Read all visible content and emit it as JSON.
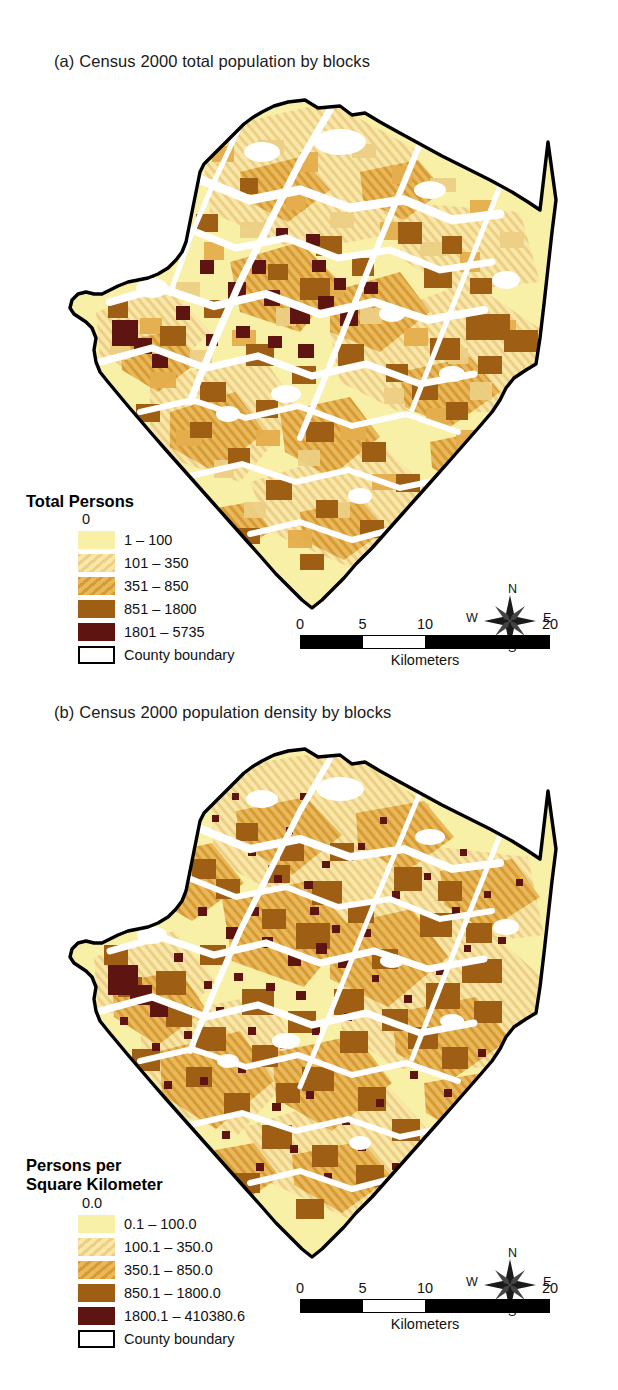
{
  "figure": {
    "panels": [
      {
        "id": "a",
        "title": "(a) Census 2000 total population by blocks",
        "legend": {
          "title": "Total Persons",
          "title_line2": "",
          "zero_label": "0",
          "classes": [
            {
              "label": "1 – 100",
              "color": "#f8f0a6",
              "pattern": "solid"
            },
            {
              "label": "101 – 350",
              "color": "#f4d98c",
              "pattern": "hatch"
            },
            {
              "label": "351 – 850",
              "color": "#e0a441",
              "pattern": "hatch"
            },
            {
              "label": "851 – 1800",
              "color": "#9e5e14",
              "pattern": "solid"
            },
            {
              "label": "1801 – 5735",
              "color": "#5e1410",
              "pattern": "solid"
            }
          ],
          "boundary_label": "County boundary"
        },
        "scalebar": {
          "ticks": [
            "0",
            "5",
            "10",
            "20"
          ],
          "unit": "Kilometers"
        },
        "compass": {
          "n": "N",
          "e": "E",
          "s": "S",
          "w": "W"
        }
      },
      {
        "id": "b",
        "title": "(b) Census 2000 population density by blocks",
        "legend": {
          "title": "Persons per",
          "title_line2": "Square Kilometer",
          "zero_label": "0.0",
          "classes": [
            {
              "label": "0.1 – 100.0",
              "color": "#f8f0a6",
              "pattern": "solid"
            },
            {
              "label": "100.1 – 350.0",
              "color": "#f4d98c",
              "pattern": "hatch"
            },
            {
              "label": "350.1 – 850.0",
              "color": "#e0a441",
              "pattern": "hatch"
            },
            {
              "label": "850.1 – 1800.0",
              "color": "#9e5e14",
              "pattern": "solid"
            },
            {
              "label": "1800.1 – 410380.6",
              "color": "#5e1410",
              "pattern": "solid"
            }
          ],
          "boundary_label": "County boundary"
        },
        "scalebar": {
          "ticks": [
            "0",
            "5",
            "10",
            "20"
          ],
          "unit": "Kilometers"
        },
        "compass": {
          "n": "N",
          "e": "E",
          "s": "S",
          "w": "W"
        }
      }
    ],
    "colors": {
      "background": "#ffffff",
      "boundary": "#000000",
      "no_data": "#ffffff",
      "class1": "#f8f0a6",
      "class2": "#f4d98c",
      "class3": "#e0a441",
      "class4": "#9e5e14",
      "class5": "#5e1410"
    }
  }
}
